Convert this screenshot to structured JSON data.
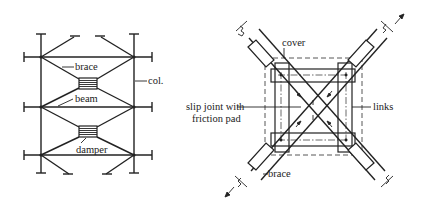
{
  "figure": {
    "left_panel": {
      "title": "Braced frame with friction dampers",
      "labels": {
        "brace": "brace",
        "beam": "beam",
        "damper": "damper",
        "column": "col."
      }
    },
    "right_panel": {
      "title": "Pall friction damper detail",
      "labels": {
        "cover": "cover",
        "slip_joint_line1": "slip joint with",
        "slip_joint_line2": "friction pad",
        "links": "links",
        "brace": "brace"
      }
    },
    "colors": {
      "line": "#222222",
      "background": "#ffffff"
    }
  }
}
